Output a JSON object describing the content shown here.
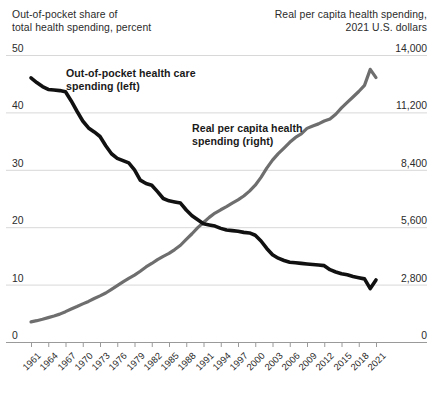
{
  "header": {
    "left_line1": "Out-of-pocket share of",
    "left_line2": "total health spending, percent",
    "right_line1": "Real per capita health spending,",
    "right_line2": "2021 U.S. dollars"
  },
  "annotations": {
    "black_line1": "Out-of-pocket health care",
    "black_line2": "spending (left)",
    "gray_line1": "Real per capita health",
    "gray_line2": "spending (right)"
  },
  "colors": {
    "black_series": "#111111",
    "gray_series": "#6e6e6e",
    "gridline": "#d8d8d8",
    "axis": "#9a9a9a",
    "text": "#2b2b2b"
  },
  "chart_data": {
    "type": "line",
    "title": "",
    "xlabel": "",
    "grid": true,
    "legend": "annotations-inline",
    "x": [
      1961,
      1962,
      1963,
      1964,
      1965,
      1966,
      1967,
      1968,
      1969,
      1970,
      1971,
      1972,
      1973,
      1974,
      1975,
      1976,
      1977,
      1978,
      1979,
      1980,
      1981,
      1982,
      1983,
      1984,
      1985,
      1986,
      1987,
      1988,
      1989,
      1990,
      1991,
      1992,
      1993,
      1994,
      1995,
      1996,
      1997,
      1998,
      1999,
      2000,
      2001,
      2002,
      2003,
      2004,
      2005,
      2006,
      2007,
      2008,
      2009,
      2010,
      2011,
      2012,
      2013,
      2014,
      2015,
      2016,
      2017,
      2018,
      2019,
      2020,
      2021
    ],
    "xticks": [
      "1961",
      "1964",
      "1967",
      "1970",
      "1973",
      "1976",
      "1979",
      "1982",
      "1985",
      "1988",
      "1991",
      "1994",
      "1997",
      "2000",
      "2003",
      "2006",
      "2009",
      "2012",
      "2015",
      "2018",
      "2021"
    ],
    "xtick_step_years": 3,
    "series": [
      {
        "name": "Out-of-pocket health care spending (left)",
        "axis": "left",
        "color": "#111111",
        "ylabel": "Out-of-pocket share of total health spending, percent",
        "ylim": [
          0,
          50
        ],
        "yticks": [
          "0",
          "10",
          "20",
          "30",
          "40",
          "50"
        ],
        "ytick_values": [
          0,
          10,
          20,
          30,
          40,
          50
        ],
        "values": [
          46.0,
          45.2,
          44.5,
          44.0,
          43.9,
          43.8,
          43.6,
          42.0,
          40.2,
          38.5,
          37.3,
          36.6,
          35.8,
          34.2,
          32.8,
          32.0,
          31.6,
          31.2,
          30.0,
          28.2,
          27.6,
          27.3,
          26.2,
          25.0,
          24.6,
          24.4,
          24.2,
          23.0,
          22.0,
          21.3,
          20.6,
          20.4,
          20.2,
          19.8,
          19.5,
          19.4,
          19.3,
          19.1,
          19.0,
          18.6,
          17.6,
          16.3,
          15.2,
          14.6,
          14.2,
          13.9,
          13.8,
          13.7,
          13.6,
          13.5,
          13.4,
          13.3,
          12.6,
          12.2,
          11.9,
          11.7,
          11.4,
          11.2,
          11.0,
          9.3,
          10.8
        ]
      },
      {
        "name": "Real per capita health spending (right)",
        "axis": "right",
        "color": "#6e6e6e",
        "ylabel": "Real per capita health spending, 2021 U.S. dollars",
        "ylim": [
          0,
          14000
        ],
        "yticks": [
          "0",
          "2,800",
          "5,600",
          "8,400",
          "11,200",
          "14,000"
        ],
        "ytick_values": [
          0,
          2800,
          5600,
          8400,
          11200,
          14000
        ],
        "values": [
          980,
          1040,
          1110,
          1190,
          1270,
          1360,
          1480,
          1610,
          1730,
          1860,
          1980,
          2120,
          2250,
          2390,
          2570,
          2750,
          2930,
          3100,
          3260,
          3450,
          3660,
          3830,
          4020,
          4180,
          4320,
          4510,
          4720,
          5010,
          5280,
          5580,
          5830,
          6080,
          6290,
          6450,
          6600,
          6770,
          6930,
          7120,
          7360,
          7650,
          8030,
          8480,
          8870,
          9190,
          9460,
          9740,
          9980,
          10150,
          10420,
          10540,
          10640,
          10780,
          10880,
          11110,
          11420,
          11690,
          11950,
          12220,
          12520,
          13300,
          12900
        ]
      }
    ]
  }
}
